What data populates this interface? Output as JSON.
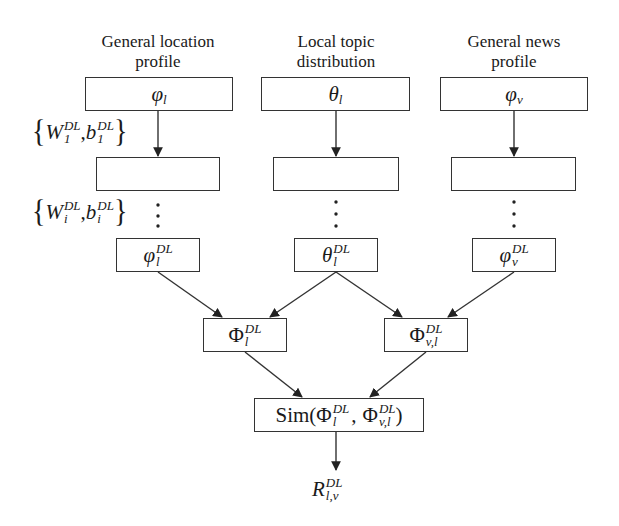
{
  "columns": [
    {
      "title_line1": "General location",
      "title_line2": "profile",
      "input": "φ",
      "input_sub": "l",
      "output": "φ",
      "output_sup": "DL",
      "output_sub": "l"
    },
    {
      "title_line1": "Local topic",
      "title_line2": "distribution",
      "input": "θ",
      "input_sub": "l",
      "output": "θ",
      "output_sup": "DL",
      "output_sub": "l"
    },
    {
      "title_line1": "General news",
      "title_line2": "profile",
      "input": "φ",
      "input_sub": "v",
      "output": "φ",
      "output_sup": "DL",
      "output_sub": "v"
    }
  ],
  "params": [
    {
      "W": "W",
      "W_sup": "DL",
      "W_sub": "1",
      "b": "b",
      "b_sup": "DL",
      "b_sub": "1"
    },
    {
      "W": "W",
      "W_sup": "DL",
      "W_sub": "i",
      "b": "b",
      "b_sup": "DL",
      "b_sub": "i"
    }
  ],
  "combine": [
    {
      "sym": "Φ",
      "sup": "DL",
      "sub": "l"
    },
    {
      "sym": "Φ",
      "sup": "DL",
      "sub": "v,l"
    }
  ],
  "similarity": {
    "fn": "Sim(",
    "a": "Φ",
    "a_sup": "DL",
    "a_sub": "l",
    "sep": ",",
    "b": "Φ",
    "b_sup": "DL",
    "b_sub": "v,l",
    "close": ")"
  },
  "result": {
    "sym": "R",
    "sup": "DL",
    "sub": "l,v"
  },
  "ellipsis": "⋮",
  "colors": {
    "line": "#333333",
    "background": "#ffffff"
  }
}
